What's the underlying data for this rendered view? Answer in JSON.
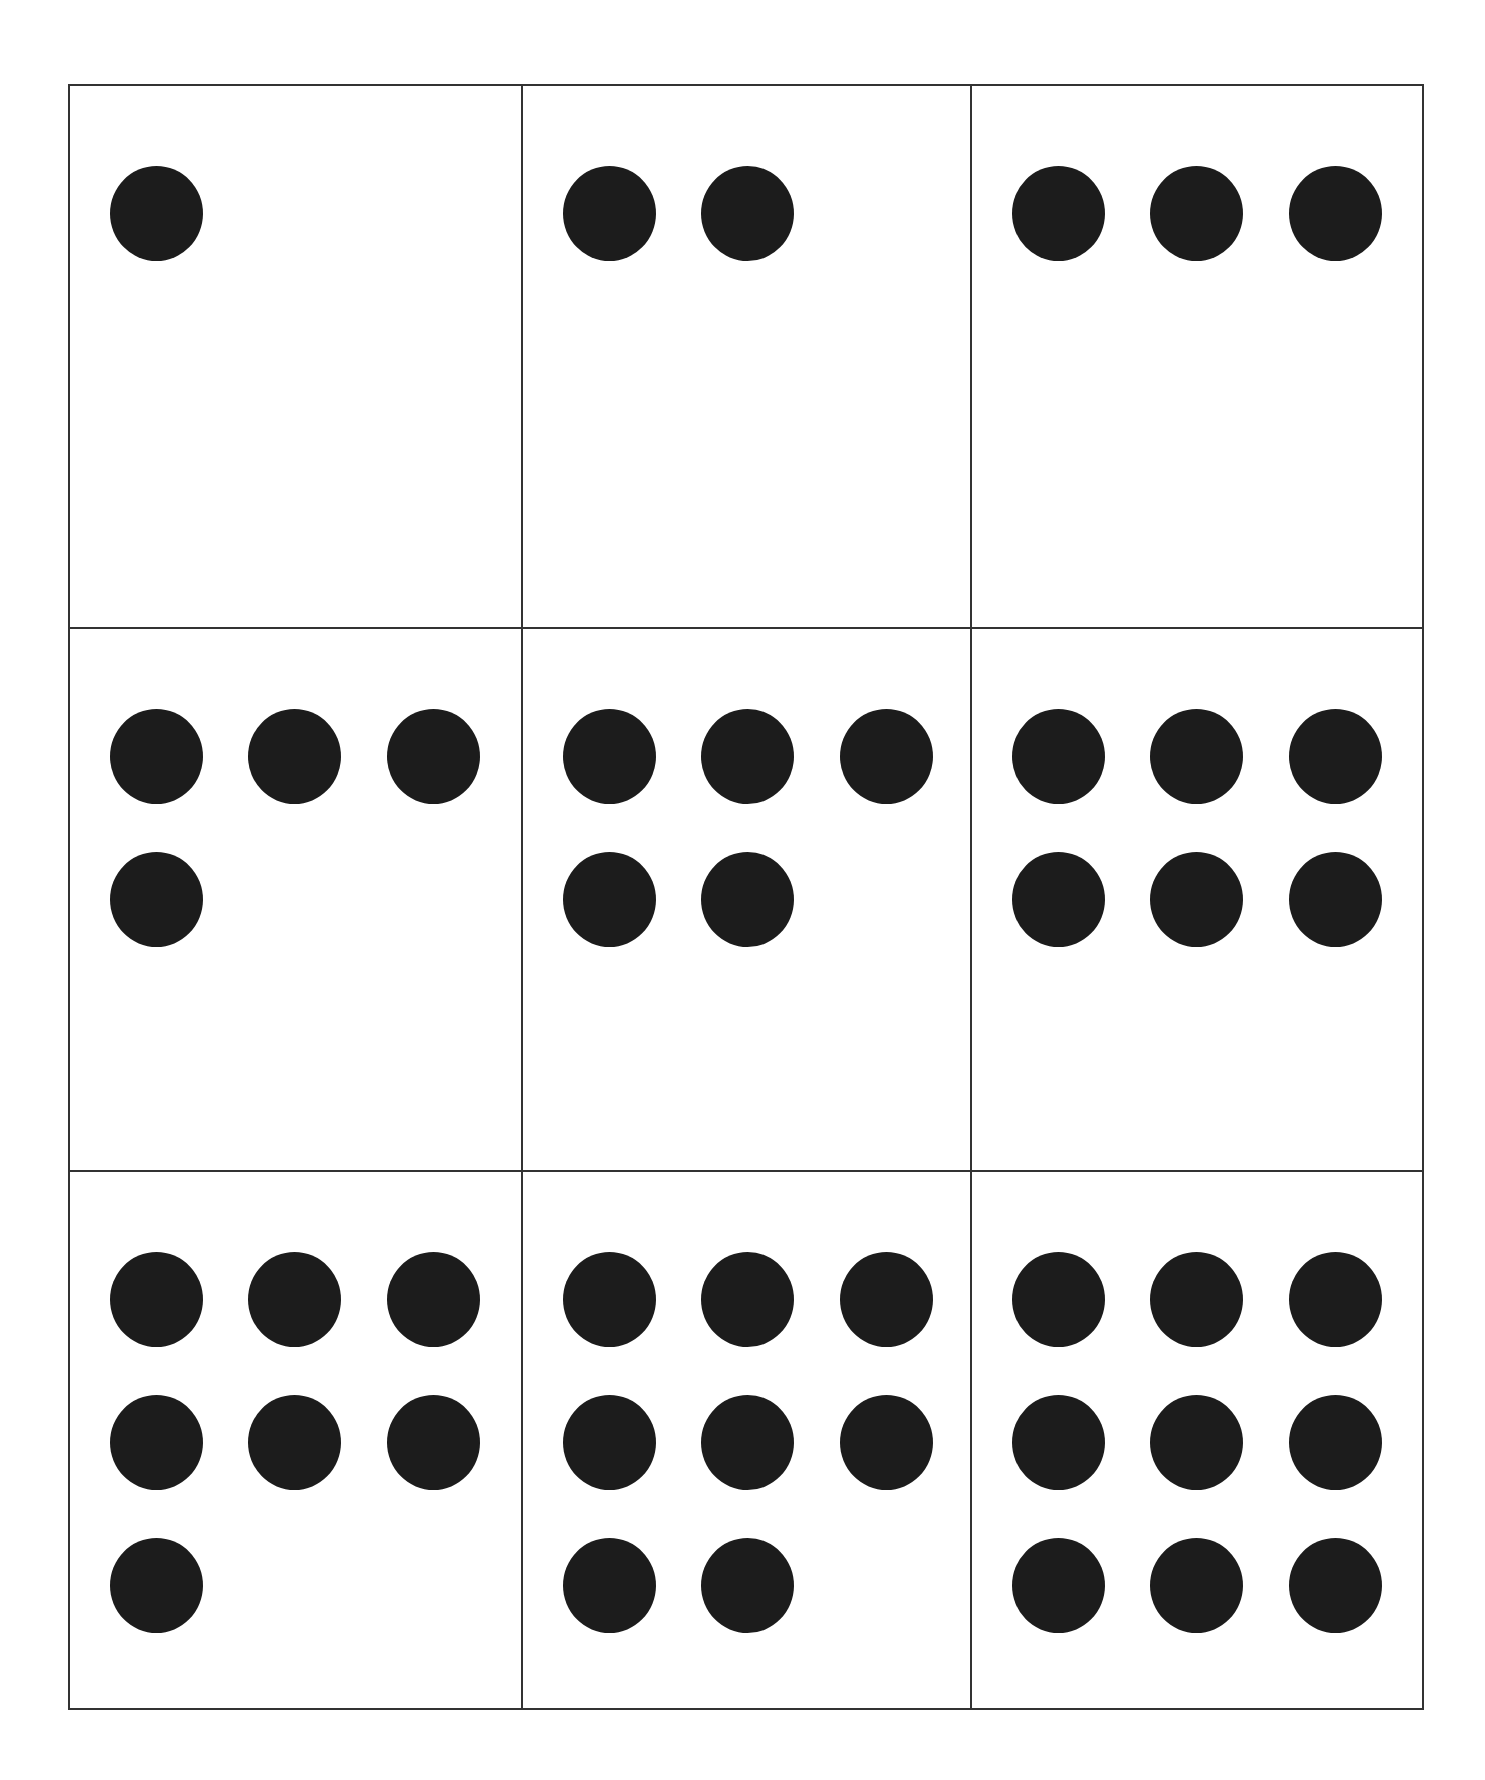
{
  "worksheet": {
    "layout": {
      "rows": 3,
      "columns": 3
    },
    "style": {
      "line_color": "#333333",
      "dot_color": "#1c1c1c",
      "background": "#ffffff"
    },
    "cards": [
      {
        "count": 1,
        "dot_rows": [
          1
        ]
      },
      {
        "count": 2,
        "dot_rows": [
          2
        ]
      },
      {
        "count": 3,
        "dot_rows": [
          3
        ]
      },
      {
        "count": 4,
        "dot_rows": [
          3,
          1
        ]
      },
      {
        "count": 5,
        "dot_rows": [
          3,
          2
        ]
      },
      {
        "count": 6,
        "dot_rows": [
          3,
          3
        ]
      },
      {
        "count": 7,
        "dot_rows": [
          3,
          3,
          1
        ]
      },
      {
        "count": 8,
        "dot_rows": [
          3,
          3,
          2
        ]
      },
      {
        "count": 9,
        "dot_rows": [
          3,
          3,
          3
        ]
      }
    ]
  }
}
